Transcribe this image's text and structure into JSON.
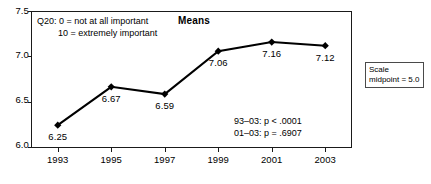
{
  "chart_data": {
    "type": "line",
    "title": "Means",
    "xlabel": "",
    "ylabel": "",
    "categories": [
      "1993",
      "1995",
      "1997",
      "1999",
      "2001",
      "2003"
    ],
    "values": [
      6.25,
      6.67,
      6.59,
      7.06,
      7.16,
      7.12
    ],
    "point_labels": [
      "6.25",
      "6.67",
      "6.59",
      "7.06",
      "7.16",
      "7.12"
    ],
    "ylim": [
      6.0,
      7.5
    ],
    "ytick_labels": [
      "7.5",
      "7.0",
      "6.5",
      "6.0"
    ],
    "ytick_values": [
      7.5,
      7.0,
      6.5,
      6.0
    ],
    "grid": false,
    "legend": "none",
    "marker": "diamond",
    "series_color": "#000000",
    "annotations": {
      "question_note_line1": "Q20: 0 = not at all important",
      "question_note_line2": "10 = extremely important",
      "stat_line1": "93–03: p < .0001",
      "stat_line2": "01–03: p = .6907",
      "scale_box_line1": "Scale",
      "scale_box_line2": "midpoint = 5.0"
    }
  }
}
